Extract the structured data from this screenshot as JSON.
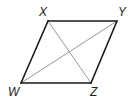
{
  "diagram": {
    "type": "parallelogram-with-diagonals",
    "colors": {
      "edge": "#1a1a1a",
      "diagonal": "#8a8a8a",
      "label": "#222222",
      "background": "#ffffff"
    },
    "vertices": [
      {
        "name": "X",
        "x": 48,
        "y": 21,
        "label_x": 39,
        "label_y": 16
      },
      {
        "name": "Y",
        "x": 117,
        "y": 21,
        "label_x": 118,
        "label_y": 16
      },
      {
        "name": "Z",
        "x": 91,
        "y": 83,
        "label_x": 90,
        "label_y": 96
      },
      {
        "name": "W",
        "x": 21,
        "y": 83,
        "label_x": 8,
        "label_y": 96
      }
    ],
    "edges": [
      [
        "X",
        "Y"
      ],
      [
        "Y",
        "Z"
      ],
      [
        "Z",
        "W"
      ],
      [
        "W",
        "X"
      ]
    ],
    "diagonals": [
      [
        "X",
        "Z"
      ],
      [
        "W",
        "Y"
      ]
    ]
  }
}
